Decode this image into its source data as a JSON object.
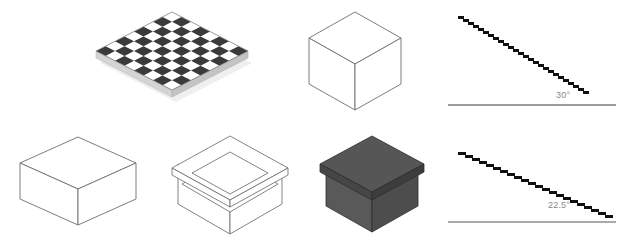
{
  "sheet": {
    "title": "Isometric projection figure sheet",
    "background_color": "#ffffff",
    "width": 644,
    "height": 248
  },
  "palette": {
    "dark_square": "#3a3a3a",
    "light_square": "#ffffff",
    "board_edge": "#d8d8d8",
    "board_shadow": "#ededed",
    "wireframe_stroke": "#6e6e6e",
    "solid_box_face_light": "#606060",
    "solid_box_face_dark": "#4c4c4c",
    "solid_box_top": "#545454",
    "solid_box_outline": "#2f2f2f",
    "baseline_gray": "#7a7a7a",
    "stair_black": "#111111",
    "label_gray": "#8a8a8a"
  },
  "figures": [
    {
      "id": "checkerboard",
      "name": "isometric-checkerboard",
      "caption": "",
      "squares_per_side": 8,
      "has_shadow": true,
      "has_side_edge": true
    },
    {
      "id": "wire-cube-iso",
      "name": "wireframe-cube-isometric",
      "caption": "",
      "faces_visible": 3,
      "style": "outline"
    },
    {
      "id": "wire-cube-flat",
      "name": "wireframe-cube-flattened",
      "caption": "",
      "faces_visible": 3,
      "style": "outline"
    },
    {
      "id": "lidded-box-wire",
      "name": "wireframe-lidded-box",
      "caption": "",
      "style": "outline"
    },
    {
      "id": "lidded-box-solid",
      "name": "shaded-lidded-box",
      "caption": "",
      "style": "shaded"
    }
  ],
  "angle_diagrams": [
    {
      "id": "angle-30",
      "name": "aliased-line-30-degrees",
      "label": "30°",
      "angle_degrees": 30,
      "steps": 26,
      "step_run_px": 5,
      "step_rise_px": 3,
      "baseline": true
    },
    {
      "id": "angle-225",
      "name": "aliased-line-22-5-degrees",
      "label": "22.5°",
      "angle_degrees": 22.5,
      "steps": 22,
      "step_run_px": 7,
      "step_rise_px": 3,
      "baseline": true
    }
  ],
  "chart_data": {
    "type": "line",
    "title": "",
    "xlabel": "",
    "ylabel": "",
    "series": [
      {
        "name": "30°",
        "label": "30°",
        "angle_degrees": 30,
        "x": [
          0,
          165
        ],
        "y": [
          95,
          0
        ],
        "rendering": "staircase-aliased"
      },
      {
        "name": "22.5°",
        "label": "22.5°",
        "angle_degrees": 22.5,
        "x": [
          0,
          165
        ],
        "y": [
          68,
          0
        ],
        "rendering": "staircase-aliased"
      }
    ]
  }
}
